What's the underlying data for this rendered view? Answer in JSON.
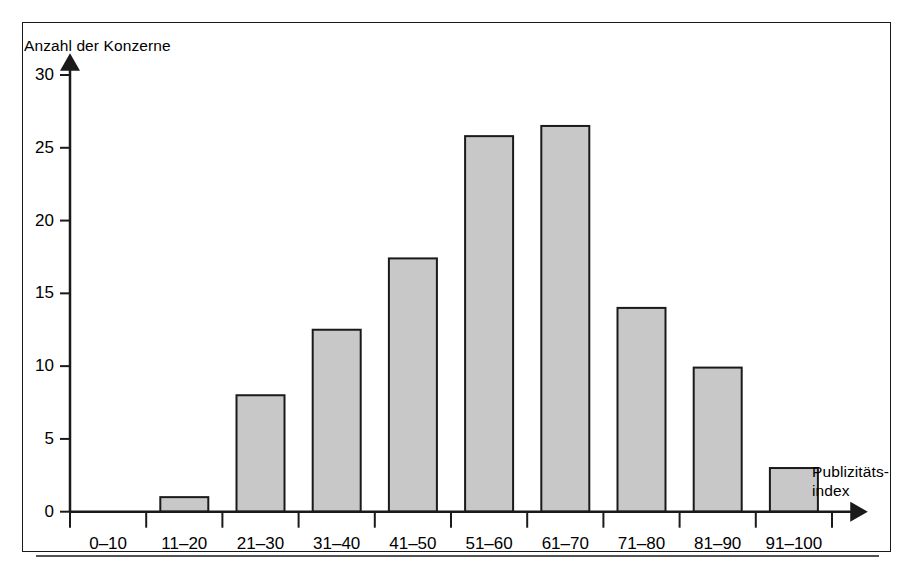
{
  "chart_data": {
    "type": "bar",
    "title": "",
    "subtitle": "",
    "xlabel": "Publizitäts-\nindex",
    "ylabel": "Anzahl der Konzerne",
    "categories": [
      "0–10",
      "11–20",
      "21–30",
      "31–40",
      "41–50",
      "51–60",
      "61–70",
      "71–80",
      "81–90",
      "91–100"
    ],
    "values": [
      0,
      1,
      8,
      12.5,
      17.4,
      25.8,
      26.5,
      14,
      9.9,
      3
    ],
    "ylim": [
      0,
      30
    ],
    "yticks": [
      0,
      5,
      10,
      15,
      20,
      25,
      30
    ],
    "ytick_labels": [
      "0",
      "5",
      "10",
      "15",
      "20",
      "25",
      "30"
    ],
    "grid": false,
    "legend": null,
    "bar_color": "#c8c8c8",
    "bar_edge_color": "#1a1a1a",
    "axis_color": "#1a1a1a",
    "background_color": "#ffffff"
  },
  "figure": {
    "y_axis_title": "Anzahl der Konzerne",
    "x_axis_title_line1": "Publizitäts-",
    "x_axis_title_line2": "index"
  }
}
